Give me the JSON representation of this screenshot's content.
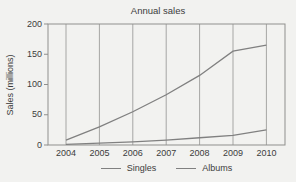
{
  "chart_data": {
    "type": "line",
    "title": "Annual sales",
    "ylabel": "Sales (millions)",
    "xlabel": "",
    "categories": [
      "2004",
      "2005",
      "2006",
      "2007",
      "2008",
      "2009",
      "2010"
    ],
    "series": [
      {
        "name": "Singles",
        "values": [
          8,
          30,
          55,
          83,
          115,
          155,
          165
        ]
      },
      {
        "name": "Albums",
        "values": [
          1,
          3,
          5,
          8,
          12,
          16,
          25
        ]
      }
    ],
    "ylim": [
      0,
      200
    ],
    "yticks": [
      0,
      50,
      100,
      150,
      200
    ],
    "grid": "vertical-only",
    "legend_position": "bottom-center",
    "colors": {
      "background": "#f2f2f0",
      "line": "#808080",
      "grid": "#a6a6a4",
      "frame": "#8f8f8d",
      "text": "#3c3c3c"
    }
  }
}
